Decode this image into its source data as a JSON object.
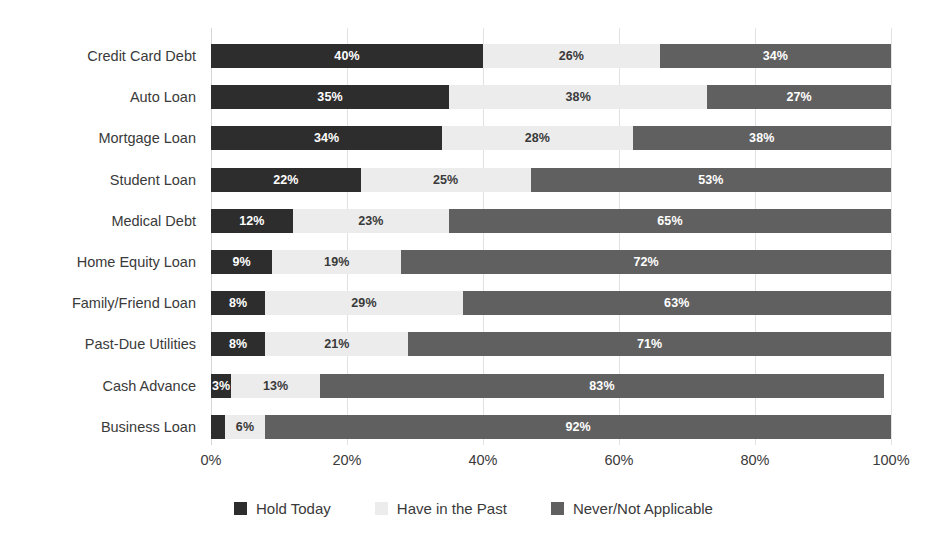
{
  "chart_data": {
    "type": "bar",
    "subtype": "stacked-horizontal-100pct",
    "title": "",
    "xlabel": "",
    "ylabel": "",
    "xlim": [
      0,
      100
    ],
    "xticks": [
      "0%",
      "20%",
      "40%",
      "60%",
      "80%",
      "100%"
    ],
    "xtick_values": [
      0,
      20,
      40,
      60,
      80,
      100
    ],
    "grid": "vertical",
    "legend_position": "bottom-center",
    "value_suffix": "%",
    "categories": [
      "Credit Card Debt",
      "Auto Loan",
      "Mortgage Loan",
      "Student Loan",
      "Medical Debt",
      "Home Equity Loan",
      "Family/Friend Loan",
      "Past-Due Utilities",
      "Cash Advance",
      "Business Loan"
    ],
    "series": [
      {
        "name": "Hold Today",
        "color": "#2d2d2d",
        "values": [
          40,
          35,
          34,
          22,
          12,
          9,
          8,
          8,
          3,
          2
        ],
        "labels": [
          "40%",
          "35%",
          "34%",
          "22%",
          "12%",
          "9%",
          "8%",
          "8%",
          "3%",
          ""
        ]
      },
      {
        "name": "Have in the Past",
        "color": "#ececec",
        "values": [
          26,
          38,
          28,
          25,
          23,
          19,
          29,
          21,
          13,
          6
        ],
        "labels": [
          "26%",
          "38%",
          "28%",
          "25%",
          "23%",
          "19%",
          "29%",
          "21%",
          "13%",
          "6%"
        ]
      },
      {
        "name": "Never/Not Applicable",
        "color": "#606060",
        "values": [
          34,
          27,
          38,
          53,
          65,
          72,
          63,
          71,
          83,
          92
        ],
        "labels": [
          "34%",
          "27%",
          "38%",
          "53%",
          "65%",
          "72%",
          "63%",
          "71%",
          "83%",
          "92%"
        ]
      }
    ]
  },
  "colors": {
    "background": "#ffffff",
    "text": "#3a3a3a",
    "gridline": "#e2e2e2",
    "hold_today": "#2d2d2d",
    "have_in_the_past": "#ececec",
    "never_not_applicable": "#606060"
  }
}
